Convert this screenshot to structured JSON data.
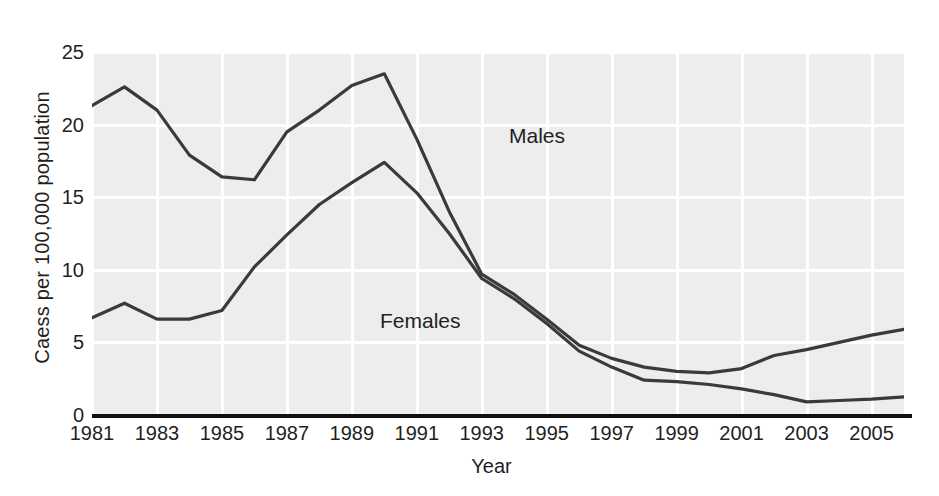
{
  "chart_data": {
    "type": "line",
    "title": "",
    "xlabel": "Year",
    "ylabel": "Caess per 100,000 population",
    "xlim": [
      1981,
      2006
    ],
    "ylim": [
      0,
      25
    ],
    "grid": true,
    "legend_position": "inline-annotations",
    "x": [
      1981,
      1982,
      1983,
      1984,
      1985,
      1986,
      1987,
      1988,
      1989,
      1990,
      1991,
      1992,
      1993,
      1994,
      1995,
      1996,
      1997,
      1998,
      1999,
      2000,
      2001,
      2002,
      2003,
      2004,
      2005,
      2006
    ],
    "xticks": [
      1981,
      1983,
      1985,
      1987,
      1989,
      1991,
      1993,
      1995,
      1997,
      1999,
      2001,
      2003,
      2005
    ],
    "xtick_labels": [
      "1981",
      "1983",
      "1985",
      "1987",
      "1989",
      "1991",
      "1993",
      "1995",
      "1997",
      "1999",
      "2001",
      "2003",
      "2005"
    ],
    "yticks": [
      0,
      5,
      10,
      15,
      20,
      25
    ],
    "ytick_labels": [
      "0",
      "5",
      "10",
      "15",
      "20",
      "25"
    ],
    "series": [
      {
        "name": "Males",
        "color": "#3a3a3a",
        "values": [
          21.3,
          22.6,
          21.0,
          17.9,
          16.4,
          16.2,
          19.5,
          21.0,
          22.7,
          23.5,
          19.0,
          14.0,
          9.7,
          8.3,
          6.6,
          4.8,
          3.9,
          3.3,
          3.0,
          2.9,
          3.2,
          4.1,
          4.5,
          5.0,
          5.5,
          5.9
        ]
      },
      {
        "name": "Females",
        "color": "#3a3a3a",
        "values": [
          6.7,
          7.7,
          6.6,
          6.6,
          7.2,
          10.2,
          12.4,
          14.5,
          16.0,
          17.4,
          15.3,
          12.5,
          9.4,
          8.0,
          6.3,
          4.4,
          3.3,
          2.4,
          2.3,
          2.1,
          1.8,
          1.4,
          0.9,
          1.0,
          1.1,
          1.25
        ]
      }
    ],
    "annotations": [
      {
        "text": "Males",
        "x": 1991.5,
        "y": 22.0
      },
      {
        "text": "Females",
        "x": 1987.5,
        "y": 11.5
      }
    ]
  },
  "style": {
    "plot_background": "#ededed",
    "gridline_color": "#ffffff",
    "axis_color": "#101010",
    "line_color": "#3a3a3a",
    "text_color": "#1f1f1f"
  }
}
